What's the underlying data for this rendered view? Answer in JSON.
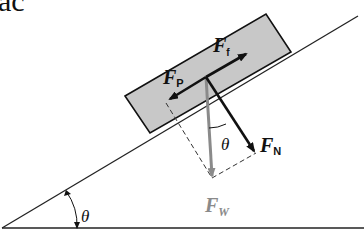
{
  "header_fragment": "ac",
  "diagram": {
    "angle_symbol": "θ",
    "forces": {
      "friction": {
        "main": "F",
        "sub": "f"
      },
      "parallel": {
        "main": "F",
        "sub": "P"
      },
      "normal": {
        "main": "F",
        "sub": "N"
      },
      "weight": {
        "main": "F",
        "sub": "W"
      }
    },
    "colors": {
      "block_fill": "#c8c8c8",
      "arrow_black": "#111111",
      "weight_arrow": "#8a8a8a",
      "weight_label": "#8a8a8a",
      "lines": "#222222"
    }
  }
}
